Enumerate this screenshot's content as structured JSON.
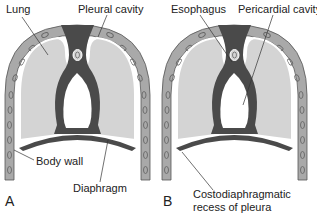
{
  "diagram": {
    "panels": [
      {
        "id": "A",
        "letter": "A",
        "labels": {
          "lung": "Lung",
          "pleural_cavity": "Pleural cavity",
          "body_wall": "Body wall",
          "diaphragm": "Diaphragm"
        }
      },
      {
        "id": "B",
        "letter": "B",
        "labels": {
          "esophagus": "Esophagus",
          "pericardial_cavity": "Pericardial cavity",
          "costodiaphragmatic_line1": "Costodiaphragmatic",
          "costodiaphragmatic_line2": "recess of pleura"
        }
      }
    ],
    "colors": {
      "body_wall": "#a9a9a9",
      "lung": "#d4d4d4",
      "mediastinum": "#4a4a4a",
      "cavity": "#ffffff",
      "outline": "#3a3a3a"
    }
  }
}
